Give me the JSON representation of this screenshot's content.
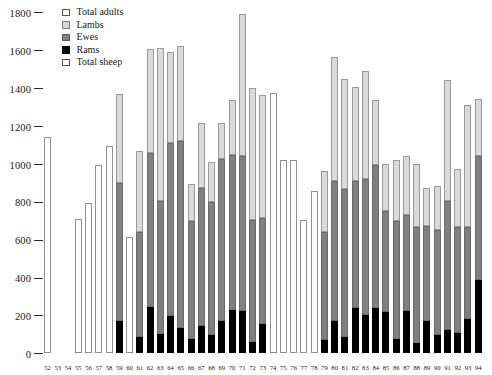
{
  "chart_data": {
    "type": "bar",
    "title": "",
    "subtitle": "",
    "xlabel": "",
    "ylabel": "",
    "ylim": [
      0,
      1800
    ],
    "ytick_step": 200,
    "yticks": [
      0,
      200,
      400,
      600,
      800,
      1000,
      1200,
      1400,
      1600,
      1800
    ],
    "ytick_labels": [
      "0",
      "200",
      "400",
      "600",
      "800",
      "1000",
      "1200",
      "1400",
      "1600",
      "1800"
    ],
    "grid": false,
    "stacked": true,
    "legend_position": "top-left",
    "legend": [
      {
        "label": "Total adults",
        "color": "#ffffff"
      },
      {
        "label": "Lambs",
        "color": "#d9d9d9"
      },
      {
        "label": "Ewes",
        "color": "#808080"
      },
      {
        "label": "Rams",
        "color": "#000000"
      },
      {
        "label": "Total sheep",
        "color": "#ffffff"
      }
    ],
    "categories": [
      "52",
      "53",
      "54",
      "55",
      "56",
      "57",
      "58",
      "59",
      "60",
      "61",
      "62",
      "63",
      "64",
      "65",
      "66",
      "67",
      "68",
      "69",
      "70",
      "71",
      "72",
      "73",
      "74",
      "75",
      "76",
      "77",
      "78",
      "79",
      "80",
      "81",
      "82",
      "83",
      "84",
      "85",
      "86",
      "87",
      "88",
      "89",
      "90",
      "91",
      "92",
      "93",
      "94"
    ],
    "series": [
      {
        "name": "Rams",
        "color": "#000000",
        "values": [
          null,
          null,
          null,
          null,
          null,
          null,
          null,
          170,
          70,
          85,
          245,
          100,
          195,
          130,
          75,
          145,
          95,
          170,
          225,
          220,
          60,
          155,
          null,
          null,
          null,
          null,
          null,
          70,
          170,
          85,
          235,
          200,
          240,
          215,
          75,
          220,
          55,
          170,
          95,
          120,
          105,
          180,
          385
        ]
      },
      {
        "name": "Ewes",
        "color": "#808080",
        "values": [
          null,
          null,
          null,
          null,
          null,
          null,
          null,
          725,
          545,
          555,
          810,
          700,
          915,
          990,
          620,
          725,
          700,
          855,
          820,
          820,
          640,
          560,
          null,
          null,
          null,
          null,
          null,
          570,
          740,
          780,
          675,
          720,
          755,
          535,
          620,
          510,
          610,
          500,
          555,
          680,
          560,
          485,
          655
        ]
      },
      {
        "name": "Lambs",
        "color": "#d9d9d9",
        "values": [
          null,
          null,
          null,
          null,
          null,
          null,
          null,
          470,
          0,
          425,
          550,
          810,
          480,
          500,
          195,
          345,
          215,
          190,
          290,
          750,
          700,
          645,
          null,
          null,
          null,
          null,
          null,
          320,
          650,
          580,
          495,
          570,
          340,
          250,
          325,
          310,
          335,
          200,
          230,
          640,
          305,
          645,
          300
        ]
      },
      {
        "name": "Total sheep",
        "color": "#ffffff",
        "values": [
          1140,
          null,
          null,
          710,
          790,
          995,
          1095,
          null,
          615,
          null,
          null,
          null,
          null,
          null,
          null,
          null,
          null,
          null,
          null,
          null,
          null,
          null,
          1375,
          1020,
          1020,
          700,
          855,
          null,
          null,
          null,
          null,
          null,
          null,
          null,
          null,
          null,
          null,
          null,
          null,
          null,
          null,
          null,
          null
        ]
      }
    ],
    "bar_totals": [
      1140,
      null,
      null,
      710,
      790,
      995,
      1095,
      1365,
      615,
      1065,
      1605,
      1610,
      1590,
      1620,
      890,
      1215,
      1010,
      1215,
      1335,
      1790,
      1400,
      1360,
      1375,
      1020,
      1020,
      700,
      855,
      960,
      1560,
      1445,
      1405,
      1490,
      1335,
      1000,
      1020,
      1040,
      1000,
      870,
      880,
      1440,
      970,
      1310,
      1340
    ]
  },
  "legend": {
    "items": [
      {
        "label": "Total adults",
        "swatch": "white-swatch"
      },
      {
        "label": "Lambs",
        "swatch": "light-gray-swatch"
      },
      {
        "label": "Ewes",
        "swatch": "mid-gray-swatch"
      },
      {
        "label": "Rams",
        "swatch": "black-swatch"
      },
      {
        "label": "Total sheep",
        "swatch": "white-swatch"
      }
    ]
  },
  "colors": {
    "lambs": "#d9d9d9",
    "ewes": "#808080",
    "rams": "#000000",
    "total_sheep": "#ffffff",
    "total_adults": "#ffffff",
    "axis": "#2b2b2b",
    "outline": "#8a8a8a"
  }
}
